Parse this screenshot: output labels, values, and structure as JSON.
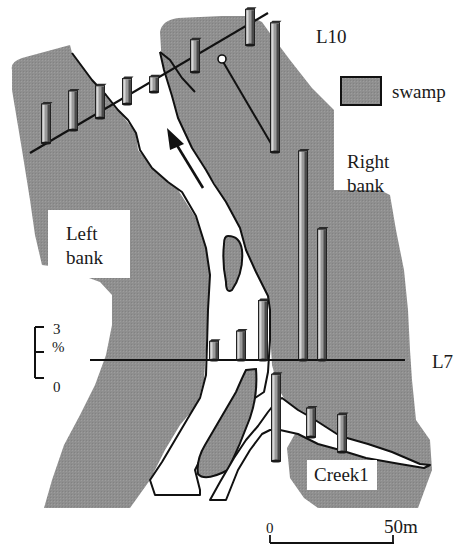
{
  "figure": {
    "colors": {
      "swamp_fill": "#8f8f8f",
      "channel_fill": "#ffffff",
      "outline": "#111111",
      "bar_front": "#9a9a9a",
      "bar_light": "#d8d8d8",
      "bar_dark": "#4a4a4a",
      "label_box": "#ffffff"
    },
    "legend": {
      "label": "swamp"
    },
    "labels": {
      "transect_top": "L10",
      "transect_mid": "L7",
      "left_bank_line1": "Left",
      "left_bank_line2": "bank",
      "right_bank_line1": "Right",
      "right_bank_line2": "bank",
      "creek": "Creek1"
    },
    "bar_scale": {
      "top_label": "3",
      "unit_label": "%",
      "bottom_label": "0"
    },
    "distance_scale": {
      "start_label": "0",
      "end_label": "50m"
    },
    "flow_arrow": {
      "direction": "upstream-northwest"
    }
  },
  "chart_data": {
    "type": "bar",
    "title": "",
    "ylabel": "%",
    "scale_bar_range": [
      0,
      3
    ],
    "series": [
      {
        "name": "L10",
        "position_index": [
          1,
          2,
          3,
          4,
          5,
          6,
          7,
          8
        ],
        "values": [
          2.3,
          2.3,
          1.9,
          1.5,
          0.9,
          1.9,
          2.1,
          7.6
        ]
      },
      {
        "name": "L7",
        "position_index": [
          1,
          2,
          3,
          4,
          5
        ],
        "values": [
          1.1,
          1.7,
          3.5,
          12.3,
          7.7
        ]
      },
      {
        "name": "Creek1",
        "position_index": [
          1,
          2,
          3
        ],
        "values": [
          5.1,
          1.7,
          2.2
        ]
      }
    ]
  }
}
